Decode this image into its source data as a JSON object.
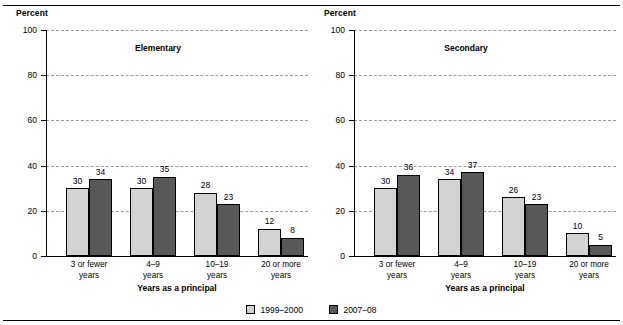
{
  "chart_data": {
    "type": "bar",
    "title": "",
    "xlabel": "Years as a principal",
    "ylabel": "Percent",
    "ylim": [
      0,
      100
    ],
    "yticks": [
      0,
      20,
      40,
      60,
      80,
      100
    ],
    "grid": true,
    "legend_position": "bottom",
    "categories": [
      "3 or fewer years",
      "4–9 years",
      "10–19 years",
      "20 or more years"
    ],
    "panels": [
      {
        "title": "Elementary",
        "ylabel": "Percent",
        "xlabel": "Years as a principal",
        "series": [
          {
            "name": "1999–2000",
            "color": "#d2d2d2",
            "values": [
              30,
              30,
              28,
              12
            ]
          },
          {
            "name": "2007–08",
            "color": "#585859",
            "values": [
              34,
              35,
              23,
              8
            ]
          }
        ]
      },
      {
        "title": "Secondary",
        "ylabel": "Percent",
        "xlabel": "Years as a principal",
        "series": [
          {
            "name": "1999–2000",
            "color": "#d2d2d2",
            "values": [
              30,
              34,
              26,
              10
            ]
          },
          {
            "name": "2007–08",
            "color": "#585859",
            "values": [
              36,
              37,
              23,
              5
            ]
          }
        ]
      }
    ],
    "legend": [
      {
        "label": "1999–2000",
        "color": "#d2d2d2"
      },
      {
        "label": "2007–08",
        "color": "#585859"
      }
    ]
  },
  "axis": {
    "y_title": "Percent",
    "x_title": "Years as a principal",
    "tick_labels": [
      "100",
      "80",
      "60",
      "40",
      "20",
      "0"
    ]
  },
  "categories": [
    {
      "line1": "3 or fewer",
      "line2": "years"
    },
    {
      "line1": "4–9",
      "line2": "years"
    },
    {
      "line1": "10–19",
      "line2": "years"
    },
    {
      "line1": "20 or more",
      "line2": "years"
    }
  ],
  "panels": {
    "elementary": {
      "title": "Elementary",
      "values_1999": [
        "30",
        "30",
        "28",
        "12"
      ],
      "values_2007": [
        "34",
        "35",
        "23",
        "8"
      ]
    },
    "secondary": {
      "title": "Secondary",
      "values_1999": [
        "30",
        "34",
        "26",
        "10"
      ],
      "values_2007": [
        "36",
        "37",
        "23",
        "5"
      ]
    }
  },
  "legend": {
    "item1": "1999–2000",
    "item2": "2007–08"
  },
  "colors": {
    "series1": "#d2d2d2",
    "series2": "#585859",
    "grid": "#9a9a9a",
    "axis": "#000000"
  }
}
